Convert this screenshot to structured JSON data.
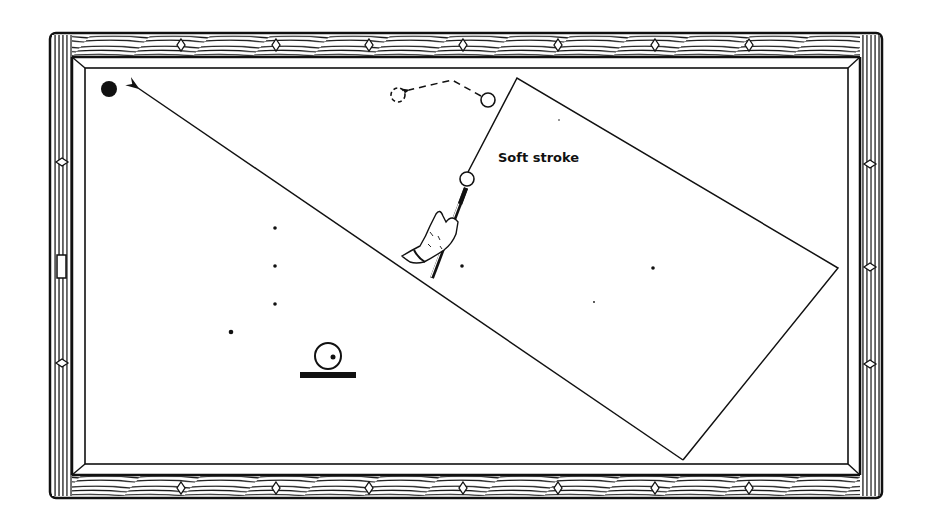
{
  "figure": {
    "type": "billiards-shot-diagram",
    "annotation": "Soft stroke",
    "colors": {
      "ink": "#111111",
      "background": "#ffffff"
    }
  },
  "table": {
    "outer": {
      "x": 50,
      "y": 33,
      "w": 832,
      "h": 465
    },
    "cushion": {
      "x": 85,
      "y": 68,
      "w": 763,
      "h": 396
    },
    "diamonds_top_x": [
      181,
      276,
      369,
      463,
      558,
      655,
      749
    ],
    "diamonds_bottom_x": [
      181,
      276,
      369,
      463,
      558,
      655,
      749
    ],
    "diamonds_left_y": [
      162,
      363
    ],
    "diamonds_right_y": [
      164,
      267,
      364
    ],
    "left_pocket_marker": {
      "x": 57,
      "y": 255,
      "w": 9,
      "h": 23
    }
  },
  "balls": {
    "target_black": {
      "cx": 109,
      "cy": 89,
      "r": 8
    },
    "cue_ball": {
      "cx": 467,
      "cy": 179,
      "r": 7
    },
    "object_ball": {
      "cx": 488,
      "cy": 100,
      "r": 7
    },
    "ghost_ball": {
      "cx": 398,
      "cy": 95,
      "r": 7
    }
  },
  "paths": {
    "main_arrow": {
      "from": [
        683,
        460
      ],
      "to": [
        138,
        88
      ]
    },
    "cue_path_polygon": [
      [
        468,
        178
      ],
      [
        517,
        78
      ],
      [
        838,
        268
      ],
      [
        683,
        460
      ]
    ],
    "object_ball_dashed": [
      [
        488,
        100
      ],
      [
        452,
        80
      ],
      [
        407,
        91
      ]
    ]
  },
  "spots": [
    {
      "cx": 275,
      "cy": 228,
      "r": 1.8
    },
    {
      "cx": 275,
      "cy": 266,
      "r": 1.8
    },
    {
      "cx": 275,
      "cy": 304,
      "r": 1.8
    },
    {
      "cx": 231,
      "cy": 332,
      "r": 2.3
    },
    {
      "cx": 462,
      "cy": 266,
      "r": 1.8
    },
    {
      "cx": 653,
      "cy": 268,
      "r": 1.8
    },
    {
      "cx": 594,
      "cy": 302,
      "r": 0.9
    },
    {
      "cx": 559,
      "cy": 120,
      "r": 0.8
    }
  ],
  "english_indicator": {
    "cx": 328,
    "cy": 356,
    "r": 13,
    "dot": {
      "cx": 333,
      "cy": 357,
      "r": 2.5
    },
    "bar": {
      "x": 300,
      "y": 372,
      "w": 56,
      "h": 6
    }
  }
}
